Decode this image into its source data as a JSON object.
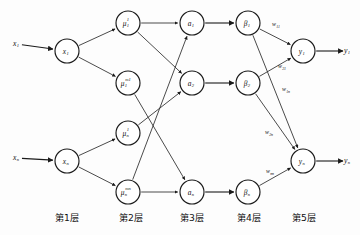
{
  "diagram": {
    "background_color": "#fdfdfd",
    "stroke_color": "#1a1a1a",
    "node_fill": "#ffffff",
    "inputs": [
      {
        "id": "in1",
        "label": "x",
        "sub": "1",
        "x": 16,
        "y": 44
      },
      {
        "id": "inn",
        "label": "x",
        "sub": "n",
        "x": 16,
        "y": 158
      }
    ],
    "outputs": [
      {
        "id": "out1",
        "label": "y",
        "sub": "1",
        "x": 347,
        "y": 51
      },
      {
        "id": "outn",
        "label": "y",
        "sub": "n",
        "x": 347,
        "y": 161
      }
    ],
    "nodes": [
      {
        "id": "x1",
        "label": "x",
        "sub": "1",
        "sup": "",
        "x": 67,
        "y": 51,
        "r": 12,
        "layer": 1
      },
      {
        "id": "xn",
        "label": "x",
        "sub": "n",
        "sup": "",
        "x": 67,
        "y": 161,
        "r": 12,
        "layer": 1
      },
      {
        "id": "mu11",
        "label": "μ",
        "sub": "1",
        "sup": "1",
        "x": 128,
        "y": 23,
        "r": 12,
        "layer": 2
      },
      {
        "id": "mu1m1",
        "label": "μ",
        "sub": "1",
        "sup": "m1",
        "x": 128,
        "y": 83,
        "r": 12,
        "layer": 2
      },
      {
        "id": "mun1",
        "label": "μ",
        "sub": "n",
        "sup": "1",
        "x": 128,
        "y": 133,
        "r": 12,
        "layer": 2
      },
      {
        "id": "munmn",
        "label": "μ",
        "sub": "n",
        "sup": "mn",
        "x": 128,
        "y": 192,
        "r": 12,
        "layer": 2
      },
      {
        "id": "a1",
        "label": "a",
        "sub": "1",
        "sup": "",
        "x": 192,
        "y": 23,
        "r": 12,
        "layer": 3
      },
      {
        "id": "a2",
        "label": "a",
        "sub": "2",
        "sup": "",
        "x": 192,
        "y": 83,
        "r": 12,
        "layer": 3
      },
      {
        "id": "an",
        "label": "a",
        "sub": "n",
        "sup": "",
        "x": 192,
        "y": 192,
        "r": 12,
        "layer": 3
      },
      {
        "id": "b1",
        "label": "β",
        "sub": "1",
        "sup": "",
        "x": 248,
        "y": 23,
        "r": 12,
        "layer": 4
      },
      {
        "id": "b2",
        "label": "β",
        "sub": "2",
        "sup": "",
        "x": 248,
        "y": 83,
        "r": 12,
        "layer": 4
      },
      {
        "id": "bn",
        "label": "β",
        "sub": "n",
        "sup": "",
        "x": 248,
        "y": 192,
        "r": 12,
        "layer": 4
      },
      {
        "id": "y1",
        "label": "y",
        "sub": "1",
        "sup": "",
        "x": 303,
        "y": 51,
        "r": 12,
        "layer": 5
      },
      {
        "id": "yn",
        "label": "y",
        "sub": "n",
        "sup": "",
        "x": 303,
        "y": 161,
        "r": 12,
        "layer": 5
      }
    ],
    "edges": [
      {
        "from": "in1",
        "to": "x1",
        "kind": "input"
      },
      {
        "from": "inn",
        "to": "xn",
        "kind": "input"
      },
      {
        "from": "x1",
        "to": "mu11",
        "kind": "fan"
      },
      {
        "from": "x1",
        "to": "mu1m1",
        "kind": "fan"
      },
      {
        "from": "xn",
        "to": "mun1",
        "kind": "fan"
      },
      {
        "from": "xn",
        "to": "munmn",
        "kind": "fan"
      },
      {
        "from": "mu11",
        "to": "a1",
        "kind": "rule"
      },
      {
        "from": "mu11",
        "to": "a2",
        "kind": "rule"
      },
      {
        "from": "mu1m1",
        "to": "an",
        "kind": "rule"
      },
      {
        "from": "mun1",
        "to": "a2",
        "kind": "rule"
      },
      {
        "from": "munmn",
        "to": "a1",
        "kind": "rule"
      },
      {
        "from": "munmn",
        "to": "an",
        "kind": "rule"
      },
      {
        "from": "a1",
        "to": "b1",
        "kind": "norm"
      },
      {
        "from": "a2",
        "to": "b2",
        "kind": "norm"
      },
      {
        "from": "an",
        "to": "bn",
        "kind": "norm"
      },
      {
        "from": "b1",
        "to": "y1",
        "kind": "weight",
        "weight": "w11"
      },
      {
        "from": "b2",
        "to": "y1",
        "kind": "weight",
        "weight": "w21"
      },
      {
        "from": "b1",
        "to": "yn",
        "kind": "weight",
        "weight": "w1n"
      },
      {
        "from": "b2",
        "to": "yn",
        "kind": "weight",
        "weight": "w2n"
      },
      {
        "from": "bn",
        "to": "yn",
        "kind": "weight",
        "weight": "wnn"
      },
      {
        "from": "y1",
        "to": "out1",
        "kind": "output"
      },
      {
        "from": "yn",
        "to": "outn",
        "kind": "output"
      }
    ],
    "weights": [
      {
        "id": "w11",
        "label": "w",
        "sub": "11",
        "x": 276,
        "y": 25
      },
      {
        "id": "w21",
        "label": "w",
        "sub": "21",
        "x": 282,
        "y": 67
      },
      {
        "id": "w1n",
        "label": "w",
        "sub": "1n",
        "x": 286,
        "y": 90
      },
      {
        "id": "w2n",
        "label": "w",
        "sub": "2n",
        "x": 269,
        "y": 133
      },
      {
        "id": "wnn",
        "label": "w",
        "sub": "nn",
        "x": 270,
        "y": 172
      }
    ],
    "layer_labels": [
      {
        "id": "layer1",
        "text": "第1层",
        "x": 67,
        "y": 218
      },
      {
        "id": "layer2",
        "text": "第2层",
        "x": 131,
        "y": 218
      },
      {
        "id": "layer3",
        "text": "第3层",
        "x": 192,
        "y": 218
      },
      {
        "id": "layer4",
        "text": "第4层",
        "x": 249,
        "y": 218
      },
      {
        "id": "layer5",
        "text": "第5层",
        "x": 304,
        "y": 218
      }
    ]
  }
}
